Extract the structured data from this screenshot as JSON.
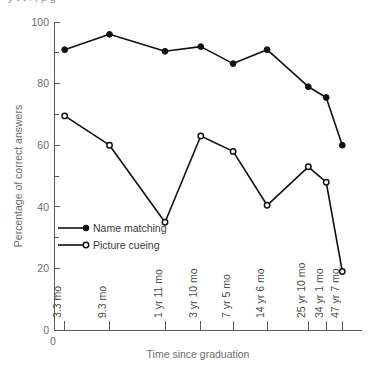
{
  "clipped_header_text": "y    t     t     l   ,   p     g",
  "chart_data": {
    "type": "line",
    "title": "",
    "xlabel": "Time since graduation",
    "ylabel": "Percentage of correct answers",
    "ylim": [
      0,
      100
    ],
    "yticks": [
      0,
      20,
      40,
      60,
      80,
      100
    ],
    "ytick_labels": [
      "0",
      "20",
      "40",
      "60",
      "80",
      "100"
    ],
    "yminor_ticks": [
      10,
      30,
      50,
      70,
      90
    ],
    "origin_label": "0",
    "grid": false,
    "legend_position": "inside-left",
    "categories": [
      "3.3 mo",
      "9.3 mo",
      "1 yr 11 mo",
      "3 yr 10 mo",
      "7 yr 5 mo",
      "14 yr 6 mo",
      "25 yr 10 mo",
      "34 yr 1 mo",
      "47 yr 7 mo"
    ],
    "category_positions": [
      0.3,
      1.55,
      3.1,
      4.1,
      5.0,
      5.95,
      7.1,
      7.6,
      8.05
    ],
    "series": [
      {
        "name": "Name matching",
        "marker": "filled-circle",
        "color": "#111111",
        "values": [
          91,
          96,
          90.5,
          92,
          86.5,
          91,
          79,
          75.5,
          60
        ]
      },
      {
        "name": "Picture cueing",
        "marker": "open-circle",
        "color": "#111111",
        "values": [
          69.5,
          60,
          35,
          63,
          58,
          40.5,
          53,
          48,
          19
        ]
      }
    ]
  },
  "legend": {
    "items": [
      {
        "label": "Name matching",
        "marker": "filled-circle"
      },
      {
        "label": "Picture cueing",
        "marker": "open-circle"
      }
    ]
  }
}
